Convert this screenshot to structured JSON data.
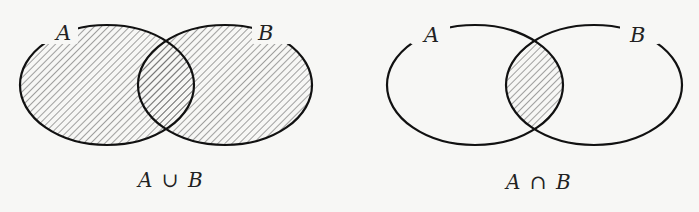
{
  "diagrams": [
    {
      "id": "union",
      "set_a_label": "A",
      "set_b_label": "B",
      "caption_a": "A",
      "caption_op": "∪",
      "caption_b": "B",
      "caption_full": "A ∪ B",
      "shaded_region": "union"
    },
    {
      "id": "intersection",
      "set_a_label": "A",
      "set_b_label": "B",
      "caption_a": "A",
      "caption_op": "∩",
      "caption_b": "B",
      "caption_full": "A ∩ B",
      "shaded_region": "intersection"
    }
  ],
  "colors": {
    "background": "#f7f7f5",
    "outline": "#111111",
    "hatch": "#555555"
  }
}
